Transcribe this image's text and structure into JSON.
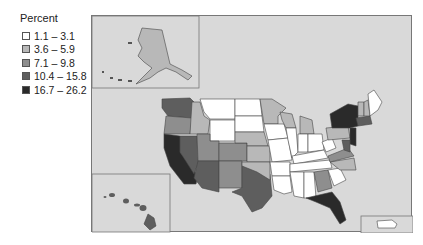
{
  "legend": {
    "title": "Percent",
    "items": [
      {
        "label": "1.1 – 3.1",
        "color": "#ffffff"
      },
      {
        "label": "3.6 – 5.9",
        "color": "#b8b8b8"
      },
      {
        "label": "7.1 – 9.8",
        "color": "#8e8e8e"
      },
      {
        "label": "10.4 – 15.8",
        "color": "#5e5e5e"
      },
      {
        "label": "16.7 – 26.2",
        "color": "#2a2a2a"
      }
    ]
  },
  "map": {
    "background": "#d9d9d9",
    "insets": [
      "Alaska",
      "Hawaii",
      "Puerto Rico"
    ],
    "states": {
      "WA": "10.4 – 15.8",
      "OR": "7.1 – 9.8",
      "CA": "16.7 – 26.2",
      "NV": "10.4 – 15.8",
      "ID": "3.6 – 5.9",
      "MT": "1.1 – 3.1",
      "WY": "1.1 – 3.1",
      "UT": "7.1 – 9.8",
      "AZ": "10.4 – 15.8",
      "CO": "7.1 – 9.8",
      "NM": "7.1 – 9.8",
      "TX": "10.4 – 15.8",
      "ND": "1.1 – 3.1",
      "SD": "1.1 – 3.1",
      "NE": "3.6 – 5.9",
      "KS": "3.6 – 5.9",
      "OK": "3.6 – 5.9",
      "MN": "3.6 – 5.9",
      "IA": "1.1 – 3.1",
      "MO": "1.1 – 3.1",
      "AR": "1.1 – 3.1",
      "LA": "1.1 – 3.1",
      "WI": "3.6 – 5.9",
      "IL": "7.1 – 9.8",
      "MI": "3.6 – 5.9",
      "IN": "1.1 – 3.1",
      "OH": "1.1 – 3.1",
      "KY": "1.1 – 3.1",
      "TN": "1.1 – 3.1",
      "MS": "1.1 – 3.1",
      "AL": "1.1 – 3.1",
      "GA": "7.1 – 9.8",
      "FL": "16.7 – 26.2",
      "SC": "1.1 – 3.1",
      "NC": "3.6 – 5.9",
      "VA": "7.1 – 9.8",
      "WV": "1.1 – 3.1",
      "PA": "3.6 – 5.9",
      "NY": "16.7 – 26.2",
      "NJ": "16.7 – 26.2",
      "MD": "10.4 – 15.8",
      "DE": "7.1 – 9.8",
      "CT": "10.4 – 15.8",
      "RI": "10.4 – 15.8",
      "MA": "10.4 – 15.8",
      "VT": "1.1 – 3.1",
      "NH": "3.6 – 5.9",
      "ME": "1.1 – 3.1",
      "AK": "3.6 – 5.9",
      "HI": "10.4 – 15.8",
      "PR": "1.1 – 3.1"
    }
  }
}
